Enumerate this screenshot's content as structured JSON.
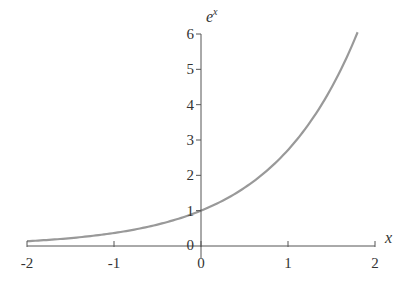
{
  "chart_data": {
    "type": "line",
    "title": "",
    "xlabel": "x",
    "ylabel": "e^x",
    "ylabel_base": "e",
    "ylabel_sup": "x",
    "xlim": [
      -2,
      2
    ],
    "ylim": [
      0,
      6
    ],
    "grid": false,
    "legend": null,
    "x_ticks": [
      -2,
      -1,
      0,
      1,
      2
    ],
    "x_tick_labels": [
      "-2",
      "-1",
      "0",
      "1",
      "2"
    ],
    "y_ticks": [
      0,
      1,
      2,
      3,
      4,
      5,
      6
    ],
    "y_tick_labels": [
      "0",
      "1",
      "2",
      "3",
      "4",
      "5",
      "6"
    ],
    "series": [
      {
        "name": "e^x",
        "function": "exp(x)",
        "color": "#999999",
        "x": [
          -2.0,
          -1.5,
          -1.0,
          -0.5,
          0.0,
          0.5,
          1.0,
          1.5,
          1.8
        ],
        "y": [
          0.135,
          0.223,
          0.368,
          0.607,
          1.0,
          1.649,
          2.718,
          4.482,
          6.05
        ]
      }
    ]
  },
  "colors": {
    "axis": "#555555",
    "curve": "#9a9a9a",
    "text": "#333333"
  }
}
